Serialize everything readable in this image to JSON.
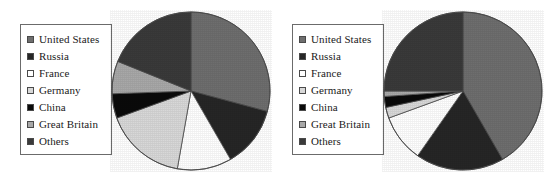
{
  "figure": {
    "background": "#ffffff",
    "width": 543,
    "height": 179,
    "panel_count": 2
  },
  "palette": {
    "united_states": "#6e6e6e",
    "russia": "#262626",
    "france": "#ffffff",
    "germany": "#d8d8d8",
    "china": "#0a0a0a",
    "great_britain": "#a8a8a8",
    "others": "#3a3a3a",
    "outline": "#4a4a4a",
    "legend_border": "#6b6b6b",
    "text": "#1a1a1a"
  },
  "legend": {
    "items": [
      {
        "label": "United States",
        "color": "#6e6e6e",
        "key": "united_states"
      },
      {
        "label": "Russia",
        "color": "#262626",
        "key": "russia"
      },
      {
        "label": "France",
        "color": "#ffffff",
        "key": "france"
      },
      {
        "label": "Germany",
        "color": "#d8d8d8",
        "key": "germany"
      },
      {
        "label": "China",
        "color": "#0a0a0a",
        "key": "china"
      },
      {
        "label": "Great Britain",
        "color": "#a8a8a8",
        "key": "great_britain"
      },
      {
        "label": "Others",
        "color": "#3a3a3a",
        "key": "others"
      }
    ]
  },
  "chart_data": [
    {
      "type": "pie",
      "title": "",
      "panel": "left",
      "start_angle": 0,
      "direction": "clockwise",
      "legend_position": "left",
      "grid": false,
      "categories": [
        "United States",
        "Russia",
        "France",
        "Germany",
        "China",
        "Great Britain",
        "Others"
      ],
      "colors": [
        "#6e6e6e",
        "#262626",
        "#ffffff",
        "#d8d8d8",
        "#0a0a0a",
        "#a8a8a8",
        "#3a3a3a"
      ],
      "values": [
        29.2,
        12.5,
        11.1,
        16.7,
        5.0,
        6.7,
        18.8
      ],
      "angles_deg": [
        105,
        45,
        40,
        60,
        18,
        24,
        68
      ],
      "units": "percent"
    },
    {
      "type": "pie",
      "title": "",
      "panel": "right",
      "start_angle": 0,
      "direction": "clockwise",
      "legend_position": "left",
      "grid": false,
      "categories": [
        "United States",
        "Russia",
        "France",
        "Germany",
        "China",
        "Great Britain",
        "Others"
      ],
      "colors": [
        "#6e6e6e",
        "#262626",
        "#ffffff",
        "#d8d8d8",
        "#0a0a0a",
        "#a8a8a8",
        "#3a3a3a"
      ],
      "values": [
        41.7,
        18.1,
        9.7,
        2.2,
        2.2,
        1.1,
        25.0
      ],
      "angles_deg": [
        150,
        65,
        35,
        8,
        8,
        4,
        90
      ],
      "units": "percent"
    }
  ]
}
